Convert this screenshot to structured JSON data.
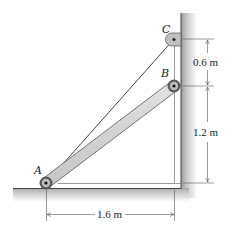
{
  "diagram": {
    "type": "statics-mechanics-figure",
    "points": {
      "A": {
        "label": "A"
      },
      "B": {
        "label": "B"
      },
      "C": {
        "label": "C"
      }
    },
    "dimensions": {
      "vertical_upper": "0.6 m",
      "vertical_lower": "1.2 m",
      "horizontal": "1.6 m"
    },
    "colors": {
      "bar_fill": "#d4d4d4",
      "bar_edge": "#555555",
      "wall_shade": "#b8b8b8",
      "line": "#333333",
      "background": "#ffffff"
    }
  }
}
